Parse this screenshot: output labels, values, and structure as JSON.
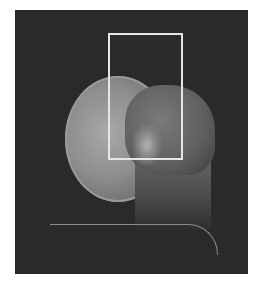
{
  "image": {
    "description": "Lateral skull X-ray radiograph",
    "background_color": "#2a2a2a",
    "annotation": {
      "type": "rectangle",
      "color": "#e6e6e6",
      "label": ""
    }
  }
}
